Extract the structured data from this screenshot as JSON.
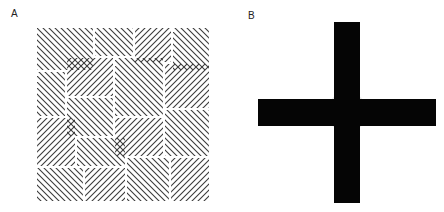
{
  "figure": {
    "panels": [
      {
        "label": "A",
        "description": "Square texture of short parallel line segments at ±45° forming a maze-like parquet pattern",
        "box": {
          "x": 36,
          "y": 27,
          "width": 174,
          "height": 175
        },
        "line_spacing": 6,
        "line_color": "#3a3a3a",
        "patches": [
          {
            "x": 0,
            "y": 0,
            "w": 58,
            "h": 44,
            "o": "d"
          },
          {
            "x": 58,
            "y": 0,
            "w": 40,
            "h": 30,
            "o": "d"
          },
          {
            "x": 98,
            "y": 0,
            "w": 38,
            "h": 36,
            "o": "a"
          },
          {
            "x": 136,
            "y": 0,
            "w": 38,
            "h": 44,
            "o": "d"
          },
          {
            "x": 0,
            "y": 44,
            "w": 30,
            "h": 46,
            "o": "d"
          },
          {
            "x": 30,
            "y": 30,
            "w": 48,
            "h": 40,
            "o": "a"
          },
          {
            "x": 78,
            "y": 30,
            "w": 50,
            "h": 60,
            "o": "d"
          },
          {
            "x": 128,
            "y": 36,
            "w": 46,
            "h": 46,
            "o": "a"
          },
          {
            "x": 30,
            "y": 70,
            "w": 48,
            "h": 40,
            "o": "d"
          },
          {
            "x": 0,
            "y": 90,
            "w": 40,
            "h": 50,
            "o": "a"
          },
          {
            "x": 78,
            "y": 90,
            "w": 50,
            "h": 40,
            "o": "a"
          },
          {
            "x": 128,
            "y": 82,
            "w": 46,
            "h": 48,
            "o": "d"
          },
          {
            "x": 40,
            "y": 110,
            "w": 50,
            "h": 30,
            "o": "d"
          },
          {
            "x": 0,
            "y": 140,
            "w": 48,
            "h": 35,
            "o": "d"
          },
          {
            "x": 48,
            "y": 140,
            "w": 42,
            "h": 35,
            "o": "a"
          },
          {
            "x": 90,
            "y": 130,
            "w": 44,
            "h": 45,
            "o": "d"
          },
          {
            "x": 134,
            "y": 130,
            "w": 40,
            "h": 45,
            "o": "a"
          }
        ]
      },
      {
        "label": "B",
        "description": "Black cross on white background with a light gray circular ring around the central intersection",
        "vertical_bar": {
          "x": 334,
          "y": 22,
          "width": 26,
          "height": 181
        },
        "horizontal_bar": {
          "x": 258,
          "y": 99,
          "width": 178,
          "height": 27
        },
        "center_circle": {
          "cx": 347,
          "cy": 112,
          "r": 20
        },
        "bar_color": "#050505",
        "circle_color": "#e8e8e8"
      }
    ]
  }
}
